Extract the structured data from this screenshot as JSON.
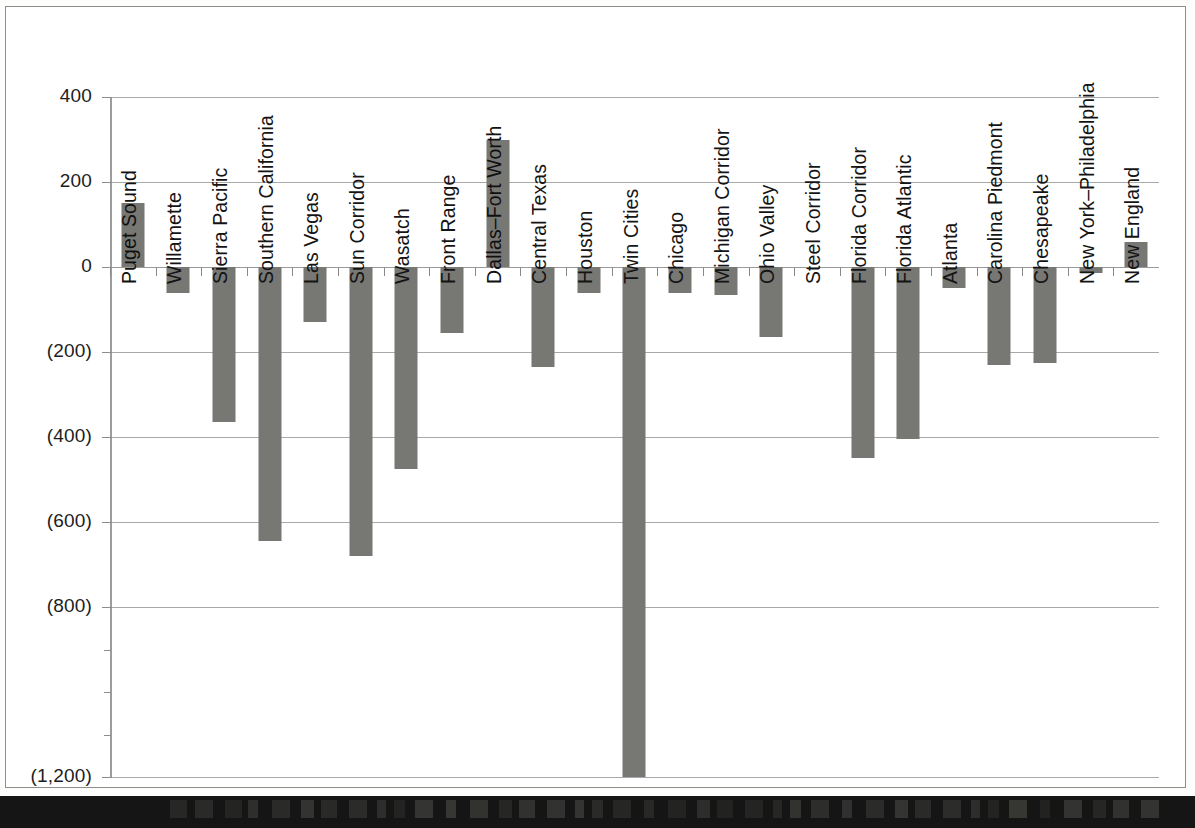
{
  "chart_data": {
    "type": "bar",
    "title": "",
    "subtitle": "",
    "xlabel": "",
    "ylabel": "",
    "ylim": [
      -1400,
      400
    ],
    "grid": true,
    "legend": null,
    "orientation": "vertical",
    "bar_color": "#777774",
    "y_tick_labels": [
      "400",
      "200",
      "0",
      "(200)",
      "(400)",
      "(600)",
      "(800)",
      "(1,200)",
      "(1,400)"
    ],
    "y_tick_values": [
      400,
      200,
      0,
      -200,
      -400,
      -600,
      -800,
      -1200,
      -1400
    ],
    "categories": [
      "Puget Sound",
      "Willamette",
      "Sierra Pacific",
      "Southern California",
      "Las Vegas",
      "Sun Corridor",
      "Wasatch",
      "Front Range",
      "Dallas–Fort Worth",
      "Central Texas",
      "Houston",
      "Twin Cities",
      "Chicago",
      "Michigan Corridor",
      "Ohio Valley",
      "Steel Corridor",
      "Florida Corridor",
      "Florida Atlantic",
      "Atlanta",
      "Carolina Piedmont",
      "Chesapeake",
      "New York–Philadelphia",
      "New England"
    ],
    "values": [
      150,
      -60,
      -365,
      -645,
      -130,
      -680,
      -475,
      -155,
      300,
      -235,
      -60,
      -1200,
      -60,
      -65,
      -165,
      0,
      -450,
      -405,
      -50,
      -230,
      -225,
      -15,
      60
    ]
  },
  "axis": {
    "zero_label": "0",
    "top_label": "400"
  }
}
